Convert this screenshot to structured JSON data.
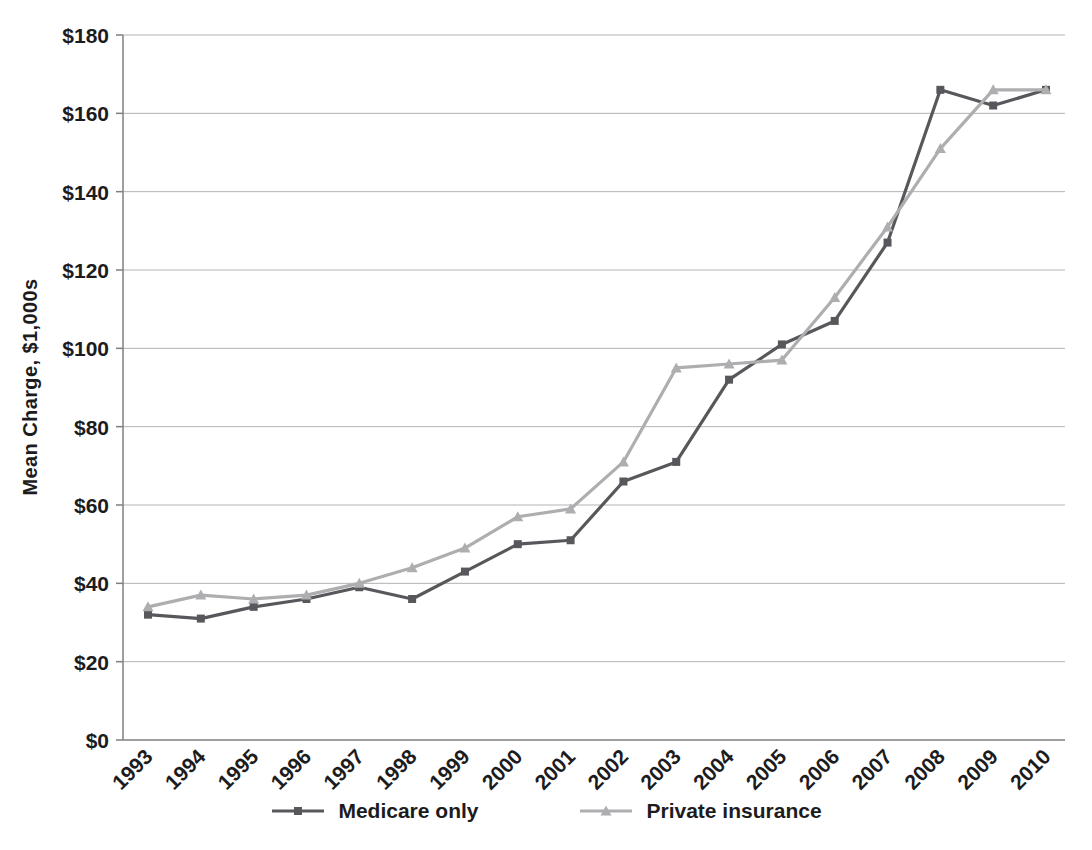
{
  "chart_data": {
    "type": "line",
    "title": "",
    "xlabel": "",
    "ylabel": "Mean Charge, $1,000s",
    "categories": [
      "1993",
      "1994",
      "1995",
      "1996",
      "1997",
      "1998",
      "1999",
      "2000",
      "2001",
      "2002",
      "2003",
      "2004",
      "2005",
      "2006",
      "2007",
      "2008",
      "2009",
      "2010"
    ],
    "series": [
      {
        "name": "Medicare only",
        "marker": "square",
        "color": "#58585c",
        "values": [
          32,
          31,
          34,
          36,
          39,
          36,
          43,
          50,
          51,
          66,
          71,
          92,
          101,
          107,
          127,
          166,
          162,
          166
        ]
      },
      {
        "name": "Private insurance",
        "marker": "triangle",
        "color": "#aeaeb1",
        "values": [
          34,
          37,
          36,
          37,
          40,
          44,
          49,
          57,
          59,
          71,
          95,
          96,
          97,
          113,
          131,
          151,
          166,
          166
        ]
      }
    ],
    "ylim": [
      0,
      180
    ],
    "y_tick_step": 20,
    "y_tick_labels": [
      "$0",
      "$20",
      "$40",
      "$60",
      "$80",
      "$100",
      "$120",
      "$140",
      "$160",
      "$180"
    ],
    "grid": true,
    "legend_position": "bottom"
  },
  "colors": {
    "background": "#ffffff",
    "grid": "#b3b3b3",
    "axis": "#7f7f82",
    "text": "#1c1c1e",
    "medicare_line": "#58585c",
    "private_line": "#aeaeb1"
  }
}
